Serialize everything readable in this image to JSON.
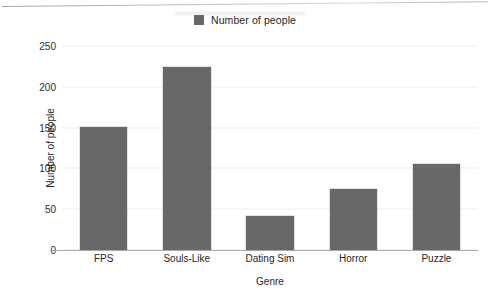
{
  "legend": {
    "swatch_name": "legend-color-swatch",
    "label": "Number of people",
    "color": "#686868",
    "position": "top-center"
  },
  "axes": {
    "y_title": "Number of people",
    "x_title": "Genre",
    "y_ticks": [
      "0",
      "50",
      "100",
      "150",
      "200",
      "250"
    ]
  },
  "colors": {
    "bar": "#686868",
    "text": "#2b2b2b",
    "baseline": "#a9a9a9",
    "background": "#ffffff"
  },
  "chart_data": {
    "type": "bar",
    "title": "",
    "subtitle": "",
    "categories": [
      "FPS",
      "Souls-Like",
      "Dating Sim",
      "Horror",
      "Puzzle"
    ],
    "values": [
      151,
      224,
      42,
      75,
      106
    ],
    "series": [
      {
        "name": "Number of people",
        "values": [
          151,
          224,
          42,
          75,
          106
        ],
        "color": "#686868"
      }
    ],
    "xlabel": "Genre",
    "ylabel": "Number of people",
    "ylim": [
      0,
      250
    ],
    "ytick_values": [
      0,
      50,
      100,
      150,
      200,
      250
    ],
    "xtick_labels": [
      "FPS",
      "Souls-Like",
      "Dating Sim",
      "Horror",
      "Puzzle"
    ],
    "grid": false,
    "legend": [
      "Number of people"
    ],
    "legend_position": "top-center",
    "orientation": "vertical"
  }
}
